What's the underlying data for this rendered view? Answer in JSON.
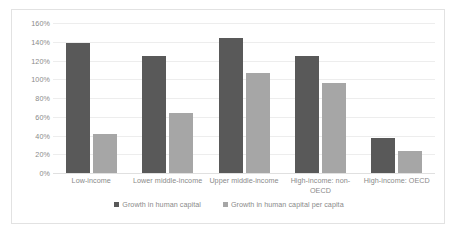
{
  "chart_data": {
    "type": "bar",
    "title": "",
    "xlabel": "",
    "ylabel": "",
    "ylim": [
      0,
      160
    ],
    "grid": true,
    "legend_position": "bottom",
    "tick_suffix": "%",
    "categories": [
      "Low-income",
      "Lower middle-income",
      "Upper middle-income",
      "High-income: non-OECD",
      "High-income: OECD"
    ],
    "ytick_labels": [
      "160%",
      "140%",
      "120%",
      "100%",
      "80%",
      "60%",
      "40%",
      "20%",
      "0%"
    ],
    "ytick_values": [
      160,
      140,
      120,
      100,
      80,
      60,
      40,
      20,
      0
    ],
    "series": [
      {
        "name": "Growth in human capital",
        "color": "#595959",
        "values": [
          139,
          125,
          144,
          125,
          37
        ]
      },
      {
        "name": "Growth in human capital per capita",
        "color": "#a6a6a6",
        "values": [
          42,
          64,
          107,
          96,
          23
        ]
      }
    ]
  },
  "colors": {
    "series_dark": "#595959",
    "series_light": "#a6a6a6",
    "gridline": "#ededed",
    "text": "#8a8a8a",
    "border": "#e2e2e2",
    "background": "#ffffff"
  }
}
